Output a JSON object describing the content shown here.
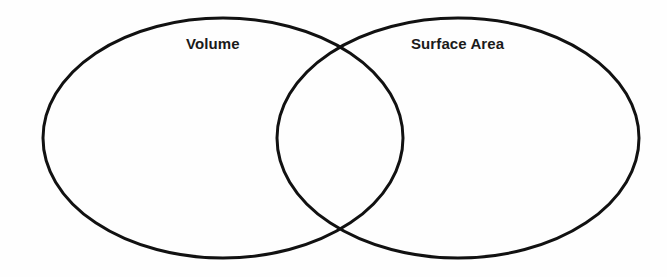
{
  "diagram": {
    "type": "venn-diagram",
    "title": "",
    "background_color": "#fefefe",
    "stroke_color": "#111111",
    "stroke_width": 3,
    "text_color": "#1a1a1a",
    "sets": [
      {
        "id": "left",
        "label": "Volume",
        "center_x": 223,
        "center_y": 138,
        "radius_x": 180,
        "radius_y": 120
      },
      {
        "id": "right",
        "label": "Surface Area",
        "center_x": 458,
        "center_y": 138,
        "radius_x": 181,
        "radius_y": 120
      }
    ],
    "intersection": {
      "label": "",
      "top_crossing_x": 340,
      "top_crossing_y": 47,
      "bottom_crossing_x": 340,
      "bottom_crossing_y": 229
    }
  }
}
